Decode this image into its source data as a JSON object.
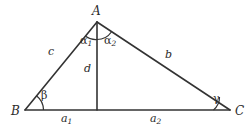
{
  "figure": {
    "type": "geometry-diagram",
    "background_color": "#ffffff",
    "stroke_color": "#333333",
    "text_color": "#2b2b2b"
  },
  "vertices": [
    {
      "id": "A",
      "label": "A",
      "x": 97,
      "y": 22,
      "label_x": 92,
      "label_y": 6
    },
    {
      "id": "B",
      "label": "B",
      "x": 25,
      "y": 110,
      "label_x": 12,
      "label_y": 106
    },
    {
      "id": "C",
      "label": "C",
      "x": 230,
      "y": 110,
      "label_x": 235,
      "label_y": 106
    },
    {
      "id": "D",
      "label": "",
      "x": 97,
      "y": 110,
      "label_x": 0,
      "label_y": 0
    }
  ],
  "segments": [
    {
      "name": "side-c",
      "from": "B",
      "to": "A"
    },
    {
      "name": "side-b",
      "from": "A",
      "to": "C"
    },
    {
      "name": "base-a",
      "from": "B",
      "to": "C"
    },
    {
      "name": "altitude-d",
      "from": "A",
      "to": "D"
    }
  ],
  "side_labels": [
    {
      "name": "c",
      "text": "c",
      "sub": "",
      "x": 48,
      "y": 47
    },
    {
      "name": "b",
      "text": "b",
      "sub": "",
      "x": 165,
      "y": 49
    },
    {
      "name": "d",
      "text": "d",
      "sub": "",
      "x": 85,
      "y": 64
    },
    {
      "name": "a1",
      "text": "a",
      "sub": "1",
      "x": 61,
      "y": 113
    },
    {
      "name": "a2",
      "text": "a",
      "sub": "2",
      "x": 150,
      "y": 113
    }
  ],
  "angle_labels": [
    {
      "name": "alpha1",
      "text": "α",
      "sub": "1",
      "x": 81,
      "y": 36
    },
    {
      "name": "alpha2",
      "text": "α",
      "sub": "2",
      "x": 105,
      "y": 36
    },
    {
      "name": "beta",
      "text": "β",
      "sub": "",
      "x": 41,
      "y": 91
    },
    {
      "name": "gamma",
      "text": "γ",
      "sub": "",
      "x": 213,
      "y": 94
    }
  ]
}
